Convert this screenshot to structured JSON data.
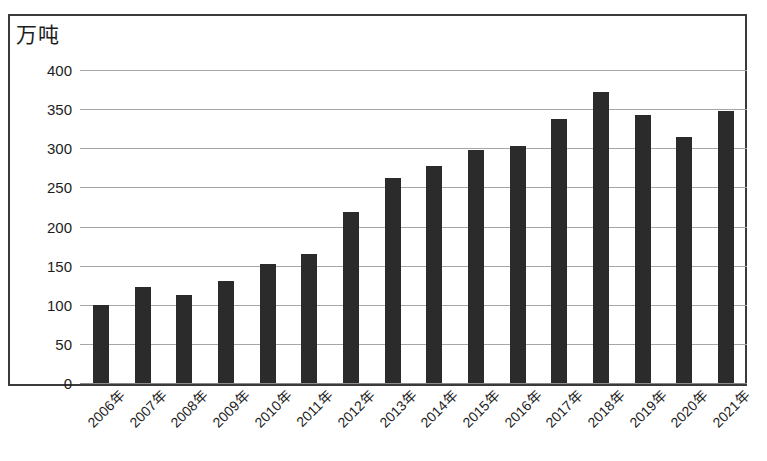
{
  "chart_data": {
    "type": "bar",
    "title": "",
    "subtitle": "",
    "xlabel": "",
    "ylabel": "万吨",
    "unit_caption": "万吨",
    "ylim": [
      0,
      400
    ],
    "ytick_step": 50,
    "ytick_labels": [
      "400",
      "350",
      "300",
      "250",
      "200",
      "150",
      "100",
      "50",
      "0"
    ],
    "ytick_values": [
      400,
      350,
      300,
      250,
      200,
      150,
      100,
      50,
      0
    ],
    "grid": true,
    "grid_axis": "y",
    "legend": null,
    "legend_position": "none",
    "categories": [
      "2006年",
      "2007年",
      "2008年",
      "2009年",
      "2010年",
      "2011年",
      "2012年",
      "2013年",
      "2014年",
      "2015年",
      "2016年",
      "2017年",
      "2018年",
      "2019年",
      "2020年",
      "2021年"
    ],
    "values": [
      100,
      123,
      112,
      130,
      152,
      165,
      218,
      262,
      277,
      298,
      303,
      338,
      372,
      343,
      314,
      347
    ],
    "series": [
      {
        "name": "产量",
        "values": [
          100,
          123,
          112,
          130,
          152,
          165,
          218,
          262,
          277,
          298,
          303,
          338,
          372,
          343,
          314,
          347
        ]
      }
    ],
    "bar_color": "#2b2b2b",
    "grid_color": "#a6a6a6",
    "frame_color": "#3a3a3a",
    "background_color": "#ffffff",
    "text_color": "#1d1d1d",
    "annotations": []
  }
}
